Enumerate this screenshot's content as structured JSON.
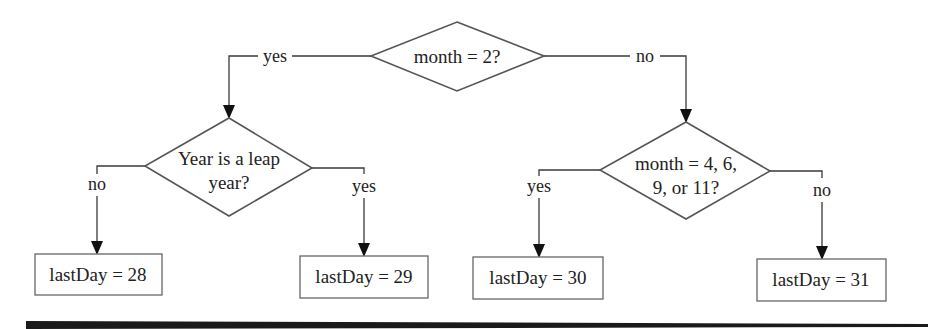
{
  "diagram": {
    "type": "flowchart",
    "decisions": {
      "root": {
        "lines": [
          "month = 2?"
        ]
      },
      "leap": {
        "lines": [
          "Year is a leap",
          "year?"
        ]
      },
      "thirty": {
        "lines": [
          "month = 4, 6,",
          "9, or 11?"
        ]
      }
    },
    "edges": {
      "root_yes": "yes",
      "root_no": "no",
      "leap_no": "no",
      "leap_yes": "yes",
      "thirty_yes": "yes",
      "thirty_no": "no"
    },
    "results": {
      "d28": "lastDay = 28",
      "d29": "lastDay = 29",
      "d30": "lastDay = 30",
      "d31": "lastDay = 31"
    },
    "colors": {
      "stroke": "#555555",
      "text": "#222222",
      "arrow": "#111111",
      "background": "#ffffff"
    }
  }
}
